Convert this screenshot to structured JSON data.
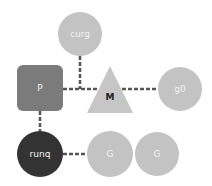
{
  "diagram": {
    "title": "",
    "colors": {
      "circle_light": "#c3c3c3",
      "square_p": "#7b7b7b",
      "triangle_m": "#c6c6c6",
      "runq": "#333333",
      "connector": "#555555",
      "label_light": "#f2f2f2",
      "label_dark": "#222222"
    },
    "nodes": [
      {
        "id": "curg",
        "shape": "circle",
        "label": "curg"
      },
      {
        "id": "P",
        "shape": "rounded-square",
        "label": "P"
      },
      {
        "id": "M",
        "shape": "triangle",
        "label": "M"
      },
      {
        "id": "g0",
        "shape": "circle",
        "label": "g0"
      },
      {
        "id": "runq",
        "shape": "circle",
        "label": "runq"
      },
      {
        "id": "G1",
        "shape": "circle",
        "label": "G"
      },
      {
        "id": "G2",
        "shape": "circle",
        "label": "G"
      }
    ],
    "edges": [
      {
        "from": "curg",
        "to": "P-M link",
        "style": "dashed"
      },
      {
        "from": "P",
        "to": "M",
        "style": "dashed"
      },
      {
        "from": "M",
        "to": "g0",
        "style": "dashed"
      },
      {
        "from": "P",
        "to": "runq",
        "style": "dashed"
      },
      {
        "from": "runq",
        "to": "G1",
        "style": "dashed"
      }
    ]
  }
}
